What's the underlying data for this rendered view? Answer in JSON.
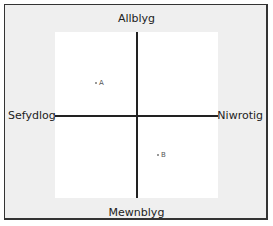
{
  "diagram": {
    "type": "quadrant",
    "axes": {
      "top": "Allblyg",
      "bottom": "Mewnblyg",
      "left": "Sefydlog",
      "right": "Niwrotig"
    },
    "points": [
      {
        "label": "A",
        "quadrant": "top-left"
      },
      {
        "label": "B",
        "quadrant": "bottom-right"
      }
    ]
  }
}
